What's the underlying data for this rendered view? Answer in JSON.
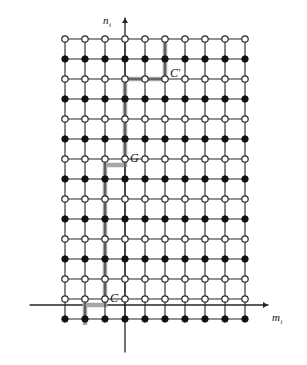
{
  "figure": {
    "type": "lattice-diagram",
    "background_color": "#ffffff",
    "line_color": "#262626",
    "path_color": "#a6a6a6",
    "node_fill_color": "#111111",
    "node_open_color": "#ffffff",
    "axes": {
      "x_label": "m",
      "x_label_sub": "i",
      "y_label": "n",
      "y_label_sub": "i",
      "x_axis_y": 305,
      "y_axis_x": 125,
      "x_start": 30,
      "x_end": 268,
      "y_start": 352,
      "y_end": 18
    },
    "grid": {
      "origin_x": 65,
      "origin_y": 39,
      "step_x": 20,
      "step_y": 20,
      "cols": 10,
      "rows": 15,
      "row_types": [
        "open",
        "filled",
        "open",
        "filled",
        "open",
        "filled",
        "open",
        "filled",
        "open",
        "filled",
        "open",
        "filled",
        "open",
        "open",
        "filled"
      ]
    },
    "labels": [
      {
        "name": "C-prime",
        "text": "C",
        "prime": "′",
        "x": 170,
        "y": 77
      },
      {
        "name": "G",
        "text": "G",
        "prime": "",
        "x": 130,
        "y": 162
      },
      {
        "name": "C",
        "text": "C",
        "prime": "",
        "x": 110,
        "y": 302
      }
    ],
    "path": {
      "name": "highlighted-contour",
      "description": "Gray contour running from below C up through G to C' and off the top of the lattice",
      "points": [
        [
          85,
          325
        ],
        [
          85,
          305
        ],
        [
          105,
          305
        ],
        [
          105,
          165
        ],
        [
          125,
          165
        ],
        [
          125,
          79
        ],
        [
          165,
          79
        ],
        [
          165,
          39
        ]
      ]
    }
  }
}
